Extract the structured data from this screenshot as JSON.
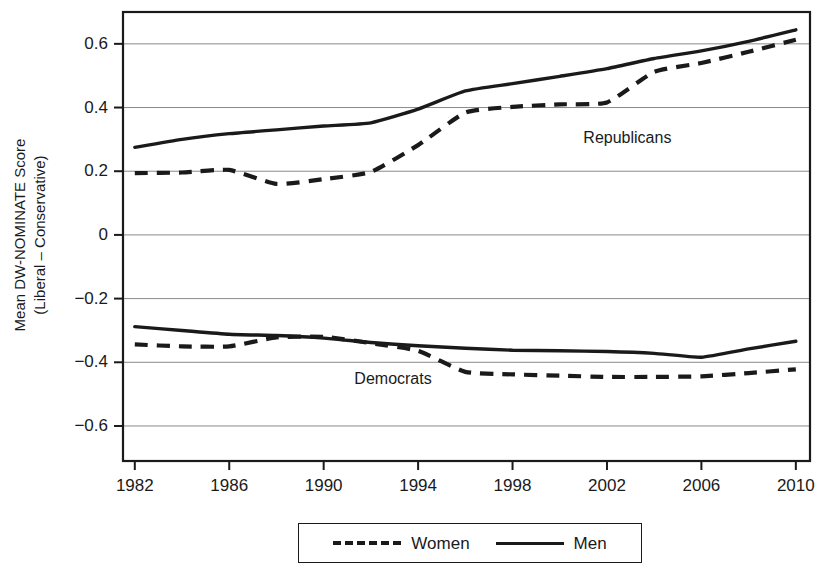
{
  "chart_data": {
    "type": "line",
    "title": "",
    "xlabel": "",
    "ylabel": "Mean DW-NOMINATE Score (Liberal – Conservative)",
    "ylabel_line1": "Mean DW-NOMINATE Score",
    "ylabel_line2": "(Liberal – Conservative)",
    "x": [
      1982,
      1984,
      1986,
      1988,
      1990,
      1992,
      1994,
      1996,
      1998,
      2000,
      2002,
      2004,
      2006,
      2008,
      2010
    ],
    "xtick_labels": [
      "1982",
      "1986",
      "1990",
      "1994",
      "1998",
      "2002",
      "2006",
      "2010"
    ],
    "xticks": [
      1982,
      1986,
      1990,
      1994,
      1998,
      2002,
      2006,
      2010
    ],
    "xlim": [
      1981.5,
      2010.6
    ],
    "ytick_labels": [
      "0.6",
      "0.4",
      "0.2",
      "0",
      "−0.2",
      "−0.4",
      "−0.6"
    ],
    "yticks": [
      0.6,
      0.4,
      0.2,
      0,
      -0.2,
      -0.4,
      -0.6
    ],
    "ylim": [
      -0.71,
      0.7
    ],
    "grid": true,
    "legend_position": "bottom",
    "line_color": "#1a1a1a",
    "series": [
      {
        "name": "Republican Men",
        "group": "Republicans",
        "legend": "Men",
        "style": "solid",
        "values": [
          0.275,
          0.3,
          0.318,
          0.33,
          0.342,
          0.352,
          0.395,
          0.452,
          0.475,
          0.498,
          0.522,
          0.554,
          0.578,
          0.608,
          0.644
        ]
      },
      {
        "name": "Republican Women",
        "group": "Republicans",
        "legend": "Women",
        "style": "dashed",
        "values": [
          0.194,
          0.196,
          0.204,
          0.16,
          0.175,
          0.198,
          0.282,
          0.384,
          0.402,
          0.41,
          0.416,
          0.512,
          0.54,
          0.575,
          0.613
        ]
      },
      {
        "name": "Democratic Men",
        "group": "Democrats",
        "legend": "Men",
        "style": "solid",
        "values": [
          -0.288,
          -0.3,
          -0.312,
          -0.316,
          -0.324,
          -0.338,
          -0.348,
          -0.356,
          -0.362,
          -0.364,
          -0.366,
          -0.372,
          -0.384,
          -0.358,
          -0.334
        ]
      },
      {
        "name": "Democratic Women",
        "group": "Democrats",
        "legend": "Women",
        "style": "dashed",
        "values": [
          -0.344,
          -0.35,
          -0.35,
          -0.322,
          -0.32,
          -0.34,
          -0.364,
          -0.43,
          -0.438,
          -0.442,
          -0.446,
          -0.446,
          -0.444,
          -0.434,
          -0.422
        ]
      }
    ],
    "annotations": [
      {
        "text": "Republicans",
        "x": 2001.0,
        "y": 0.305
      },
      {
        "text": "Democrats",
        "x": 1991.3,
        "y": -0.452
      }
    ],
    "legend": {
      "entries": [
        {
          "label": "Women",
          "style": "dashed"
        },
        {
          "label": "Men",
          "style": "solid"
        }
      ]
    }
  }
}
